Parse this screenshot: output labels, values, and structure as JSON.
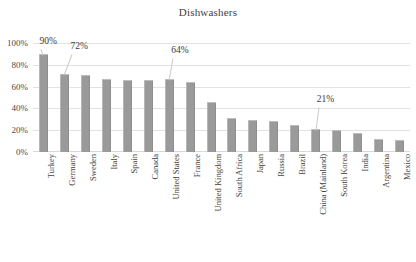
{
  "chart_data": {
    "type": "bar",
    "title": "Dishwashers",
    "xlabel": "",
    "ylabel": "",
    "ylim": [
      0,
      100
    ],
    "yticks": [
      "0%",
      "20%",
      "40%",
      "60%",
      "80%",
      "100%"
    ],
    "grid": true,
    "legend": "none",
    "value_unit": "%",
    "categories": [
      "Turkey",
      "Germany",
      "Sweden",
      "Italy",
      "Spain",
      "Canada",
      "United States",
      "France",
      "United Kingdom",
      "South Africa",
      "Japan",
      "Russia",
      "Brazil",
      "China (Mainland)",
      "South Korea",
      "India",
      "Argentina",
      "Mexico"
    ],
    "values": [
      90,
      72,
      71,
      67,
      66,
      66,
      67,
      64,
      46,
      31,
      29,
      28,
      25,
      21,
      20,
      17,
      12,
      11
    ],
    "annotations": [
      {
        "category": "Turkey",
        "label": "90%"
      },
      {
        "category": "Germany",
        "label": "72%"
      },
      {
        "category": "United States",
        "label": "64%"
      },
      {
        "category": "China (Mainland)",
        "label": "21%"
      }
    ]
  },
  "colors": {
    "bar_fill": "#9a9a9a",
    "bar_highlight": "#b6b6b6",
    "gridline": "#e2e2e2",
    "text": "#3b3b3b",
    "background": "#ffffff"
  }
}
